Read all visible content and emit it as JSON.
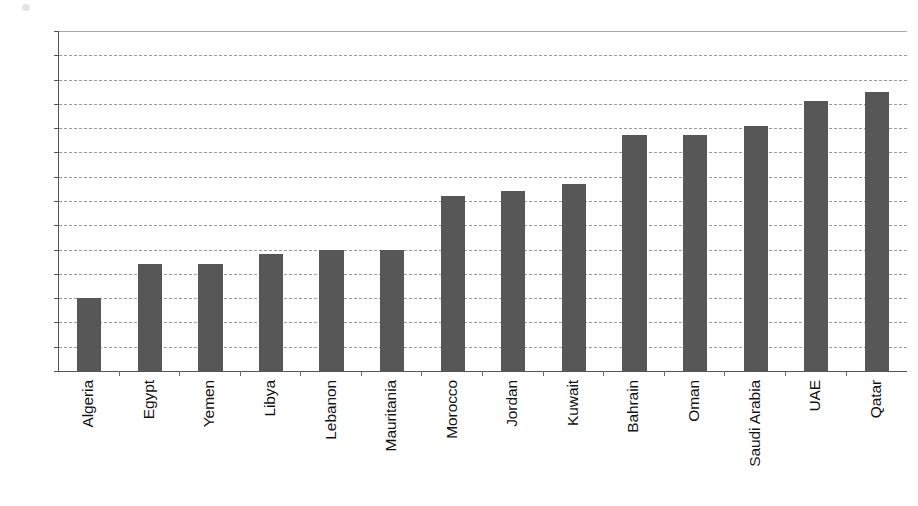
{
  "chart_data": {
    "type": "bar",
    "title": "",
    "subtitle": "",
    "xlabel": "",
    "ylabel": "",
    "categories": [
      "Algeria",
      "Egypt",
      "Yemen",
      "Libya",
      "Lebanon",
      "Mauritania",
      "Morocco",
      "Jordan",
      "Kuwait",
      "Bahrain",
      "Oman",
      "Saudi Arabia",
      "UAE",
      "Qatar"
    ],
    "values": [
      1.5,
      2.2,
      2.2,
      2.4,
      2.5,
      2.5,
      3.6,
      3.7,
      3.85,
      4.85,
      4.85,
      5.05,
      5.55,
      5.75
    ],
    "ylim": [
      0.0,
      7.0
    ],
    "ytick_labels": [
      "7.0",
      "6.5",
      "6.0",
      "5.5",
      "5.0",
      "4.5",
      "4.0",
      "3.5",
      "3.0",
      "2.5",
      "2.0",
      "1.5",
      "1.0",
      "0.5",
      "0.0"
    ],
    "ytick_values": [
      7.0,
      6.5,
      6.0,
      5.5,
      5.0,
      4.5,
      4.0,
      3.5,
      3.0,
      2.5,
      2.0,
      1.5,
      1.0,
      0.5,
      0.0
    ],
    "ytick_step": 0.5,
    "grid": true,
    "grid_axis": "y",
    "legend": null,
    "legend_position": "none",
    "orientation": "vertical",
    "series": [
      {
        "name": "",
        "values": [
          1.5,
          2.2,
          2.2,
          2.4,
          2.5,
          2.5,
          3.6,
          3.7,
          3.85,
          4.85,
          4.85,
          5.05,
          5.55,
          5.75
        ]
      }
    ]
  },
  "style": {
    "bar_color": "#575757",
    "grid_color": "#8a8a8a",
    "axis_color": "#555555",
    "text_color": "#121212",
    "background": "#ffffff"
  }
}
